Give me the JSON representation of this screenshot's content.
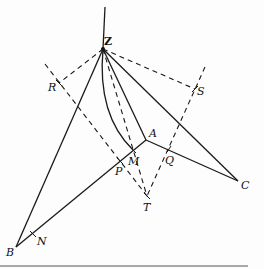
{
  "diagram": {
    "type": "geometric-construction",
    "points": {
      "Z": {
        "label": "Z",
        "x": 103,
        "y": 49
      },
      "R": {
        "label": "R",
        "x": 59,
        "y": 83
      },
      "S": {
        "label": "S",
        "x": 195,
        "y": 89
      },
      "A": {
        "label": "A",
        "x": 146,
        "y": 140
      },
      "M": {
        "label": "M",
        "x": 133,
        "y": 150
      },
      "P": {
        "label": "P",
        "x": 120,
        "y": 161
      },
      "Q": {
        "label": "Q",
        "x": 169,
        "y": 149
      },
      "T": {
        "label": "T",
        "x": 147,
        "y": 196
      },
      "C": {
        "label": "C",
        "x": 238,
        "y": 181
      },
      "B": {
        "label": "B",
        "x": 16,
        "y": 247
      },
      "N": {
        "label": "N",
        "x": 33,
        "y": 234
      }
    },
    "labels": [
      "Z",
      "R",
      "S",
      "A",
      "M",
      "P",
      "Q",
      "T",
      "C",
      "B",
      "N"
    ],
    "solid_segments": [
      "Z-vertical",
      "Z-B",
      "Z-A",
      "Z-C",
      "A-B",
      "A-C",
      "Z-M (arc)"
    ],
    "dashed_segments": [
      "Z-R",
      "Z-S",
      "R-T",
      "S-T",
      "Z-T"
    ],
    "line_color": "#1a1a1a"
  }
}
